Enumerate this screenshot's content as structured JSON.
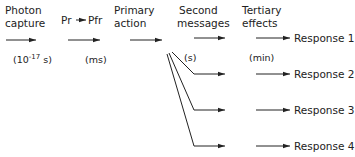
{
  "diagram": {
    "stages": [
      {
        "line1": "Photon",
        "line2": "capture",
        "timescale_pre": "(10",
        "timescale_exp": "-17",
        "timescale_post": " s)"
      },
      {
        "line1": "Pr",
        "arrow": "→",
        "line2": "Pfr",
        "timescale": "(ms)"
      },
      {
        "line1": "Primary",
        "line2": "action"
      },
      {
        "line1": "Second",
        "line2": "messages",
        "timescale": "(s)"
      },
      {
        "line1": "Tertiary",
        "line2": "effects",
        "timescale": "(min)"
      }
    ],
    "responses": [
      "Response 1",
      "Response 2",
      "Response 3",
      "Response 4"
    ]
  }
}
